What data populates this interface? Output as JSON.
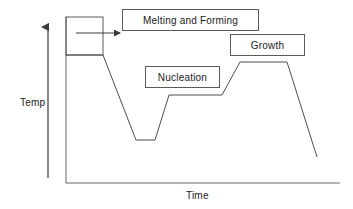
{
  "figure": {
    "title": "",
    "background_color": "#ffffff",
    "line_color": "#4d4d4d",
    "text_color": "#1a1a1a",
    "box_border_color": "#5a5a5a"
  },
  "axes": {
    "y_axis": {
      "label": "Temp",
      "arrow_direction": "up",
      "arrow_name": "temp-arrow"
    },
    "x_axis": {
      "label": "Time"
    }
  },
  "callouts": [
    {
      "id": "melting",
      "label": "Melting and Forming"
    },
    {
      "id": "growth",
      "label": "Growth"
    },
    {
      "id": "nucleation",
      "label": "Nucleation"
    }
  ],
  "annotations": {
    "highlight_box_name": "melting-region-highlight-box",
    "pointer_name": "melting-callout-arrow"
  },
  "chart_data": {
    "type": "line",
    "title": "",
    "xlabel": "Time",
    "ylabel": "Temp",
    "grid": false,
    "legend": "none",
    "series": [
      {
        "name": "Thermal profile",
        "points": [
          {
            "x": 66,
            "y": 55,
            "stage": "melting-hold-start"
          },
          {
            "x": 103,
            "y": 55,
            "stage": "melting-hold-end"
          },
          {
            "x": 136,
            "y": 140,
            "stage": "quench-bottom-start"
          },
          {
            "x": 155,
            "y": 140,
            "stage": "quench-bottom-end"
          },
          {
            "x": 169,
            "y": 95,
            "stage": "nucleation-plateau-start"
          },
          {
            "x": 222,
            "y": 95,
            "stage": "nucleation-plateau-end"
          },
          {
            "x": 240,
            "y": 62,
            "stage": "growth-plateau-start"
          },
          {
            "x": 287,
            "y": 62,
            "stage": "growth-plateau-end"
          },
          {
            "x": 317,
            "y": 157,
            "stage": "final-cooldown"
          }
        ]
      }
    ],
    "axis_geometry": {
      "y_axis_x": 66,
      "x_axis_y": 183,
      "x_axis_end": 340,
      "y_axis_top": 17
    }
  }
}
